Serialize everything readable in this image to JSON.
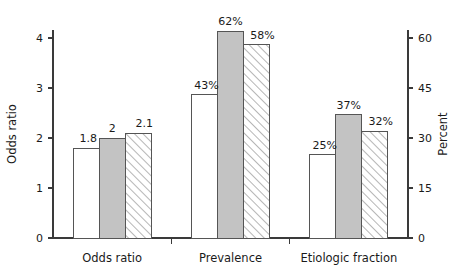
{
  "chart_data": {
    "type": "bar",
    "title": "",
    "subtitle": "",
    "categories": [
      "Odds ratio",
      "Prevalence",
      "Etiologic fraction"
    ],
    "series": [
      {
        "name": "open",
        "style": "white-unfilled",
        "values": [
          1.8,
          43,
          25
        ],
        "labels": [
          "1.8",
          "43%",
          "25%"
        ]
      },
      {
        "name": "solid",
        "style": "gray-filled",
        "values": [
          2,
          62,
          37
        ],
        "labels": [
          "2",
          "62%",
          "37%"
        ]
      },
      {
        "name": "hatched",
        "style": "diagonal-hatch",
        "values": [
          2.1,
          58,
          32
        ],
        "labels": [
          "2.1",
          "58%",
          "32%"
        ]
      }
    ],
    "axes": {
      "left": {
        "label": "Odds ratio",
        "ticks": [
          "0",
          "1",
          "2",
          "3",
          "4"
        ],
        "tick_values": [
          0,
          1,
          2,
          3,
          4
        ],
        "lim": [
          0,
          4.5
        ]
      },
      "right": {
        "label": "Percent",
        "ticks": [
          "0",
          "15",
          "30",
          "45",
          "60"
        ],
        "tick_values": [
          0,
          15,
          30,
          45,
          60
        ],
        "lim": [
          0,
          67.5
        ]
      },
      "x": {
        "label": "",
        "tick_labels": [
          "Odds ratio",
          "Prevalence",
          "Etiologic fraction"
        ]
      }
    },
    "grid": false,
    "legend": "none",
    "colors": {
      "solid_fill": "#c3c3c3",
      "open_fill": "#ffffff",
      "bar_stroke": "#555555",
      "hatch_stroke": "#6e6e6e",
      "axis": "#3a3a3a",
      "text": "#1a1a1a"
    }
  }
}
